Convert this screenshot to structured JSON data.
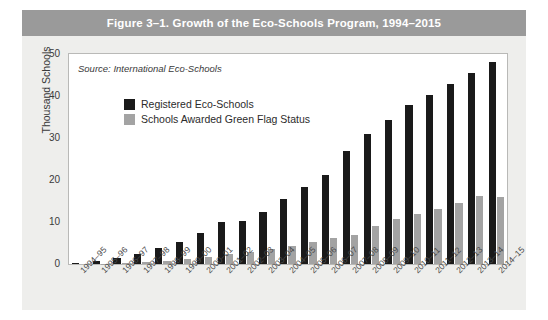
{
  "figure": {
    "title": "Figure 3–1. Growth of the Eco-Schools Program, 1994–2015",
    "source_note": "Source: International Eco-Schools",
    "band_color": "#9a9a9a",
    "panel_color": "#eeeeec"
  },
  "legend": {
    "position": "inside-top-left",
    "items": [
      {
        "label": "Registered Eco-Schools",
        "color": "#1a1a1a"
      },
      {
        "label": "Schools Awarded Green Flag Status",
        "color": "#a3a3a3"
      }
    ]
  },
  "chart_data": {
    "type": "bar",
    "title": "Figure 3–1. Growth of the Eco-Schools Program, 1994–2015",
    "xlabel": "",
    "ylabel": "Thousand Schools",
    "ylim": [
      0,
      50
    ],
    "yticks": [
      0,
      10,
      20,
      30,
      40,
      50
    ],
    "grid": false,
    "legend_position": "inside-top-left",
    "categories": [
      "1994–95",
      "1995–96",
      "1996–97",
      "1997–98",
      "1998–99",
      "1999–00",
      "2000–01",
      "2001–02",
      "2002–03",
      "2003–04",
      "2004–05",
      "2005–06",
      "2006–07",
      "2007–08",
      "2008–09",
      "2009–10",
      "2010–11",
      "2011–12",
      "2012–13",
      "2013–14",
      "2014–15"
    ],
    "series": [
      {
        "name": "Registered Eco-Schools",
        "color": "#1a1a1a",
        "values": [
          0.3,
          0.8,
          1.4,
          2.5,
          3.8,
          5.3,
          7.3,
          10.0,
          10.3,
          12.4,
          15.5,
          18.3,
          21.2,
          27.0,
          31.0,
          34.4,
          37.8,
          40.3,
          42.8,
          45.4,
          48.0
        ]
      },
      {
        "name": "Schools Awarded Green Flag Status",
        "color": "#a3a3a3",
        "values": [
          0.0,
          0.1,
          0.2,
          0.4,
          0.7,
          1.1,
          1.6,
          2.3,
          2.8,
          3.6,
          4.3,
          5.2,
          6.2,
          7.0,
          9.0,
          10.8,
          11.8,
          13.1,
          14.5,
          16.3,
          15.9
        ]
      }
    ]
  }
}
